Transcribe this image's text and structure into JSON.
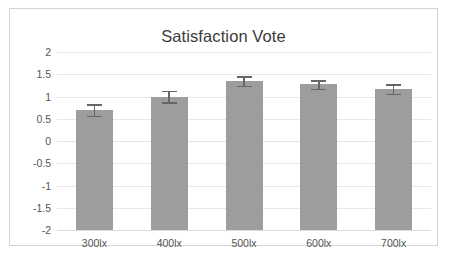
{
  "chart_data": {
    "type": "bar",
    "title": "Satisfaction Vote",
    "xlabel": "",
    "ylabel": "",
    "categories": [
      "300lx",
      "400lx",
      "500lx",
      "600lx",
      "700lx"
    ],
    "values": [
      0.7,
      1.0,
      1.35,
      1.27,
      1.17
    ],
    "errors": [
      0.13,
      0.13,
      0.11,
      0.1,
      0.11
    ],
    "ylim": [
      -2,
      2
    ],
    "yticks": [
      2,
      1.5,
      1,
      0.5,
      0,
      -0.5,
      -1,
      -1.5,
      -2
    ],
    "ytick_labels": [
      "2",
      "1.5",
      "1",
      "0.5",
      "0",
      "-0.5",
      "-1",
      "-1.5",
      "-2"
    ],
    "grid": true,
    "legend": false,
    "series": [
      {
        "name": "Satisfaction Vote",
        "values": [
          0.7,
          1.0,
          1.35,
          1.27,
          1.17
        ]
      }
    ],
    "colors": {
      "bar_fill": "#9d9d9d",
      "error_bar": "#666666",
      "gridline": "#e8e8e8",
      "text": "#555555",
      "title_text": "#3b3b3b",
      "frame_border": "#d4d4d4",
      "background": "#ffffff"
    }
  }
}
